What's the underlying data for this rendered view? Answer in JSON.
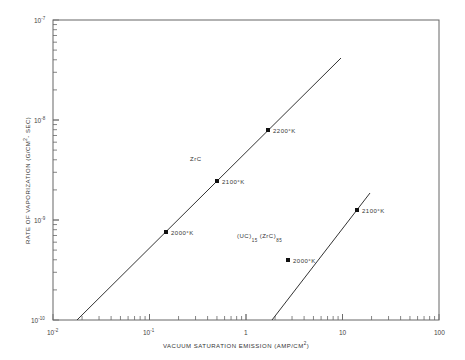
{
  "chart_data": {
    "type": "line",
    "title": "",
    "xlabel": "VACUUM SATURATION EMISSION (AMP/CM²)",
    "ylabel": "RATE OF VAPORIZATION (G/CM²-SEC)",
    "xscale": "log",
    "yscale": "log",
    "xlim": [
      0.01,
      100
    ],
    "ylim": [
      1e-10,
      1e-07
    ],
    "grid": false,
    "x_tick_labels": [
      "10^-2",
      "10^-1",
      "1",
      "10",
      "100"
    ],
    "y_tick_labels": [
      "10^-10",
      "10^-9",
      "10^-8",
      "10^-7"
    ],
    "series": [
      {
        "name": "ZrC",
        "line_start": {
          "x": 0.0165,
          "y": 1e-10
        },
        "line_end": {
          "x": 9.5,
          "y": 4e-08
        },
        "points": [
          {
            "x": 0.15,
            "y": 7.6e-10,
            "label": "2000°K"
          },
          {
            "x": 0.5,
            "y": 2.45e-09,
            "label": "2100°K"
          },
          {
            "x": 1.7,
            "y": 8e-09,
            "label": "2200°K"
          }
        ]
      },
      {
        "name": "(UC)15 (ZrC)85",
        "line_start": {
          "x": 0.85,
          "y": 1e-10
        },
        "line_end": {
          "x": 9.5,
          "y": 1.85e-09
        },
        "points": [
          {
            "x": 2.7,
            "y": 4e-10,
            "label": "2000°K"
          },
          {
            "x": 7.0,
            "y": 1.26e-09,
            "label": "2100°K"
          }
        ]
      }
    ],
    "annotations": [
      "ZrC",
      "(UC)15 (ZrC)85"
    ]
  },
  "axes": {
    "xlabel_main": "VACUUM  SATURATION  EMISSION  (AMP/CM",
    "xlabel_sup": "2",
    "xlabel_end": ")",
    "ylabel_main": "RATE  OF  VAPORIZATION  (G/CM",
    "ylabel_sup": "2",
    "ylabel_end": "- SEC)",
    "x_ticks": [
      {
        "base": "10",
        "exp": "-2"
      },
      {
        "base": "10",
        "exp": "-1"
      },
      {
        "base": "1",
        "exp": ""
      },
      {
        "base": "10",
        "exp": ""
      },
      {
        "base": "100",
        "exp": ""
      }
    ],
    "y_ticks": [
      {
        "base": "10",
        "exp": "-7"
      },
      {
        "base": "10",
        "exp": "-8"
      },
      {
        "base": "10",
        "exp": "-9"
      },
      {
        "base": "10",
        "exp": "-10"
      }
    ]
  },
  "labels": {
    "zrc": "ZrC",
    "uc_a": "(UC)",
    "uc_a_sub": "15",
    "uc_b": "(ZrC)",
    "uc_b_sub": "85",
    "zrc_2000": "2000°K",
    "zrc_2100": "2100°K",
    "zrc_2200": "2200°K",
    "uc_2000": "2000°K",
    "uc_2100": "2100°K"
  },
  "colors": {
    "line": "#333333",
    "frame": "#555555",
    "text": "#333333"
  }
}
